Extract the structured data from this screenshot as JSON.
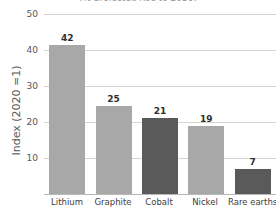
{
  "chart_data": {
    "type": "bar",
    "title": "(% projected rise to 2050)",
    "title_clipped": true,
    "xlabel": "",
    "ylabel": "Index (2020 =1)",
    "categories": [
      "Lithium",
      "Graphite",
      "Cobalt",
      "Nickel",
      "Rare earths"
    ],
    "values": [
      42,
      25,
      21,
      19,
      7
    ],
    "bar_tops": [
      41.5,
      24.5,
      21,
      19,
      7
    ],
    "data_labels": [
      "42",
      "25",
      "21",
      "19",
      "7"
    ],
    "bar_colors": [
      "#a8a8a8",
      "#a8a8a8",
      "#5a5a5a",
      "#a8a8a8",
      "#5a5a5a"
    ],
    "ylim": [
      0,
      50
    ],
    "yticks": [
      50,
      40,
      30,
      20,
      10
    ],
    "ytick_labels": [
      "50",
      "40",
      "30",
      "20",
      "10"
    ],
    "grid": true,
    "grid_color": "#d4d4d4",
    "legend": null,
    "legend_position": "none",
    "axis_color": "#b8b8b8",
    "background": "#ffffff",
    "text_color": "#58585a"
  }
}
